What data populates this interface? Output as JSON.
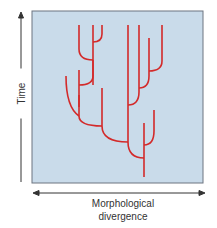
{
  "diagram": {
    "type": "phylogenetic-tree",
    "y_axis_label": "Time",
    "x_axis_label_line1": "Morphological",
    "x_axis_label_line2": "divergence",
    "colors": {
      "panel_fill": "#c9dbea",
      "panel_border": "#6d7480",
      "branch": "#d32a2a",
      "axis": "#333333"
    },
    "branches": [
      "M144,177 L144,123",
      "M144,158 Q128,158 128,142 L128,25",
      "M144,145 Q154,145 154,131 L154,110",
      "M128,142 Q102,142 102,126 L102,88",
      "M102,126 Q79,126 79,116 L79,95",
      "M79,116 Q66,107 66,76",
      "M79,107 L79,70",
      "M79,85 Q93,85 93,76 L93,60",
      "M93,85 L93,25",
      "M93,60 Q79,60 79,49 L79,25",
      "M93,42 Q102,42 102,34 L102,25",
      "M128,105 Q139,105 139,92 L139,66",
      "M139,88 Q149,88 149,76 L149,38",
      "M149,71 Q162,71 162,61 L162,25",
      "M139,66 L139,25"
    ]
  }
}
